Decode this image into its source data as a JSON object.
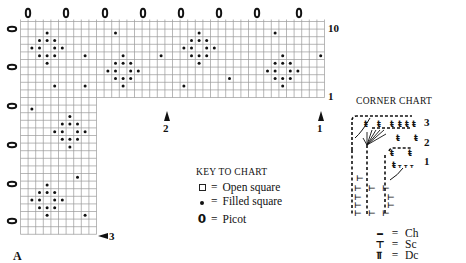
{
  "figure_label": "A",
  "grid": {
    "origin_x": 20.5,
    "origin_y": 21.5,
    "cell": 7.6,
    "cols": 40,
    "rows": 28,
    "top_band_rows": 10,
    "left_column_cols": 10,
    "line_color": "#9a9a9a",
    "border_color": "#777777",
    "dot_color": "#111111",
    "filled_cells": [
      [
        3,
        1
      ],
      [
        2,
        2
      ],
      [
        3,
        2
      ],
      [
        4,
        2
      ],
      [
        1,
        3
      ],
      [
        2,
        3
      ],
      [
        4,
        3
      ],
      [
        5,
        3
      ],
      [
        2,
        4
      ],
      [
        3,
        4
      ],
      [
        4,
        4
      ],
      [
        3,
        5
      ],
      [
        4,
        8
      ],
      [
        8,
        4
      ],
      [
        8,
        8
      ],
      [
        12,
        1
      ],
      [
        13,
        4
      ],
      [
        12,
        5
      ],
      [
        13,
        5
      ],
      [
        14,
        5
      ],
      [
        11,
        6
      ],
      [
        12,
        6
      ],
      [
        14,
        6
      ],
      [
        15,
        6
      ],
      [
        12,
        7
      ],
      [
        13,
        7
      ],
      [
        14,
        7
      ],
      [
        13,
        8
      ],
      [
        18,
        4
      ],
      [
        23,
        1
      ],
      [
        22,
        2
      ],
      [
        23,
        2
      ],
      [
        24,
        2
      ],
      [
        21,
        3
      ],
      [
        22,
        3
      ],
      [
        24,
        3
      ],
      [
        25,
        3
      ],
      [
        22,
        4
      ],
      [
        23,
        4
      ],
      [
        24,
        4
      ],
      [
        23,
        5
      ],
      [
        27,
        7
      ],
      [
        21,
        8
      ],
      [
        33,
        1
      ],
      [
        34,
        4
      ],
      [
        39,
        4
      ],
      [
        33,
        5
      ],
      [
        34,
        5
      ],
      [
        35,
        5
      ],
      [
        32,
        6
      ],
      [
        33,
        6
      ],
      [
        35,
        6
      ],
      [
        36,
        6
      ],
      [
        33,
        7
      ],
      [
        34,
        7
      ],
      [
        35,
        7
      ],
      [
        34,
        8
      ],
      [
        1,
        11
      ],
      [
        6,
        12
      ],
      [
        5,
        13
      ],
      [
        6,
        13
      ],
      [
        7,
        13
      ],
      [
        4,
        14
      ],
      [
        5,
        14
      ],
      [
        7,
        14
      ],
      [
        8,
        14
      ],
      [
        5,
        15
      ],
      [
        6,
        15
      ],
      [
        7,
        15
      ],
      [
        6,
        16
      ],
      [
        7,
        20
      ],
      [
        3,
        21
      ],
      [
        2,
        22
      ],
      [
        3,
        22
      ],
      [
        4,
        22
      ],
      [
        1,
        23
      ],
      [
        2,
        23
      ],
      [
        4,
        23
      ],
      [
        5,
        23
      ],
      [
        2,
        24
      ],
      [
        3,
        24
      ],
      [
        4,
        24
      ],
      [
        3,
        25
      ],
      [
        8,
        25
      ]
    ],
    "picots_top_x": [
      28,
      66,
      105,
      143,
      181,
      219,
      257,
      299
    ],
    "picots_left_y": [
      29,
      67,
      106,
      145,
      184,
      221
    ]
  },
  "row_markers": {
    "row_10_label": "10",
    "row_1_label": "1",
    "arrow_1_label": "1",
    "arrow_2_label": "2",
    "arrow_3_label": "3"
  },
  "key": {
    "title": "KEY TO CHART",
    "items": [
      {
        "icon": "open-square-icon",
        "eq": "=",
        "label": "Open square"
      },
      {
        "icon": "filled-square-dot-icon",
        "eq": "=",
        "label": "Filled square"
      },
      {
        "icon": "picot-icon",
        "symbol": "0",
        "eq": "=",
        "label": "Picot"
      }
    ]
  },
  "corner_chart": {
    "title": "CORNER CHART",
    "row_labels": [
      "3",
      "2",
      "1"
    ]
  },
  "stitch_key": {
    "items": [
      {
        "symbol": "▬",
        "eq": "=",
        "label": "Ch"
      },
      {
        "symbol": "⊤",
        "eq": "=",
        "label": "Sc"
      },
      {
        "symbol": "⫪",
        "eq": "=",
        "label": "Dc"
      }
    ]
  }
}
